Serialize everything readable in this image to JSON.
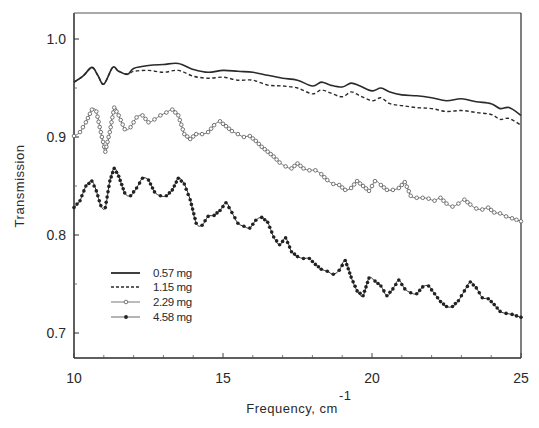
{
  "chart_data": {
    "type": "line",
    "title": "",
    "xlabel": "Frequency, cm",
    "xlabel_superscript": "-1",
    "ylabel": "Transmission",
    "xlim": [
      10,
      25
    ],
    "ylim": [
      0.675,
      1.025
    ],
    "x_ticks": [
      10,
      15,
      20,
      25
    ],
    "x_tick_labels": [
      "10",
      "15",
      "20",
      "25"
    ],
    "y_ticks": [
      0.7,
      0.8,
      0.9,
      1.0
    ],
    "y_tick_labels": [
      "0.7",
      "0.8",
      "0.9",
      "1.0"
    ],
    "grid": false,
    "legend_position": "lower left (inside axes)",
    "series": [
      {
        "name": "0.57 mg",
        "style": "solid",
        "marker": "none",
        "x": [
          10.0,
          10.3,
          10.6,
          10.8,
          11.0,
          11.3,
          11.5,
          11.8,
          12.0,
          12.5,
          13.0,
          13.5,
          14.0,
          14.5,
          15.0,
          15.5,
          16.0,
          16.5,
          17.0,
          17.5,
          18.0,
          18.3,
          18.6,
          19.0,
          19.3,
          19.6,
          20.0,
          20.3,
          20.6,
          21.0,
          21.5,
          22.0,
          22.5,
          23.0,
          23.5,
          24.0,
          24.3,
          24.6,
          25.0
        ],
        "values": [
          0.956,
          0.962,
          0.971,
          0.963,
          0.954,
          0.971,
          0.967,
          0.964,
          0.97,
          0.973,
          0.974,
          0.975,
          0.969,
          0.966,
          0.968,
          0.967,
          0.966,
          0.963,
          0.96,
          0.958,
          0.952,
          0.956,
          0.953,
          0.951,
          0.955,
          0.952,
          0.947,
          0.95,
          0.946,
          0.943,
          0.942,
          0.94,
          0.937,
          0.939,
          0.936,
          0.934,
          0.929,
          0.93,
          0.922
        ]
      },
      {
        "name": "1.15 mg",
        "style": "dashed",
        "marker": "none",
        "x": [
          10.0,
          10.3,
          10.6,
          10.8,
          11.0,
          11.3,
          11.5,
          11.8,
          12.0,
          12.5,
          13.0,
          13.5,
          14.0,
          14.5,
          15.0,
          15.5,
          16.0,
          16.5,
          17.0,
          17.5,
          18.0,
          18.3,
          18.6,
          19.0,
          19.3,
          19.6,
          20.0,
          20.3,
          20.6,
          21.0,
          21.5,
          22.0,
          22.5,
          23.0,
          23.5,
          24.0,
          24.3,
          24.6,
          25.0
        ],
        "values": [
          0.956,
          0.962,
          0.971,
          0.963,
          0.954,
          0.971,
          0.967,
          0.964,
          0.967,
          0.968,
          0.966,
          0.968,
          0.962,
          0.96,
          0.961,
          0.958,
          0.958,
          0.953,
          0.952,
          0.95,
          0.944,
          0.948,
          0.945,
          0.941,
          0.946,
          0.942,
          0.937,
          0.94,
          0.934,
          0.932,
          0.93,
          0.929,
          0.926,
          0.927,
          0.925,
          0.923,
          0.918,
          0.919,
          0.912
        ]
      },
      {
        "name": "2.29 mg",
        "style": "dotted",
        "marker": "open-circle",
        "x": [
          10.0,
          10.2,
          10.4,
          10.6,
          10.75,
          10.9,
          11.05,
          11.2,
          11.35,
          11.5,
          11.7,
          11.9,
          12.1,
          12.3,
          12.5,
          12.7,
          12.9,
          13.1,
          13.3,
          13.5,
          13.7,
          13.9,
          14.1,
          14.3,
          14.5,
          14.7,
          14.9,
          15.1,
          15.3,
          15.5,
          15.7,
          15.9,
          16.1,
          16.3,
          16.5,
          16.7,
          16.9,
          17.1,
          17.3,
          17.5,
          17.7,
          17.9,
          18.1,
          18.3,
          18.5,
          18.7,
          18.9,
          19.1,
          19.3,
          19.5,
          19.7,
          19.9,
          20.1,
          20.3,
          20.5,
          20.7,
          20.9,
          21.1,
          21.3,
          21.5,
          21.7,
          21.9,
          22.1,
          22.3,
          22.5,
          22.7,
          22.9,
          23.1,
          23.3,
          23.5,
          23.7,
          23.9,
          24.1,
          24.3,
          24.5,
          24.7,
          25.0
        ],
        "values": [
          0.901,
          0.905,
          0.915,
          0.928,
          0.926,
          0.905,
          0.885,
          0.905,
          0.93,
          0.922,
          0.908,
          0.91,
          0.92,
          0.922,
          0.915,
          0.918,
          0.922,
          0.925,
          0.928,
          0.922,
          0.903,
          0.898,
          0.903,
          0.903,
          0.905,
          0.912,
          0.916,
          0.911,
          0.906,
          0.903,
          0.9,
          0.901,
          0.896,
          0.89,
          0.885,
          0.88,
          0.874,
          0.87,
          0.868,
          0.873,
          0.868,
          0.866,
          0.866,
          0.862,
          0.856,
          0.852,
          0.851,
          0.846,
          0.848,
          0.855,
          0.85,
          0.845,
          0.855,
          0.851,
          0.846,
          0.846,
          0.848,
          0.854,
          0.84,
          0.838,
          0.838,
          0.837,
          0.835,
          0.838,
          0.832,
          0.829,
          0.832,
          0.836,
          0.831,
          0.827,
          0.826,
          0.828,
          0.823,
          0.822,
          0.819,
          0.817,
          0.814
        ]
      },
      {
        "name": "4.58 mg",
        "style": "solid-thin",
        "marker": "filled-circle",
        "x": [
          10.0,
          10.2,
          10.4,
          10.6,
          10.75,
          10.9,
          11.05,
          11.2,
          11.35,
          11.5,
          11.7,
          11.9,
          12.1,
          12.3,
          12.5,
          12.7,
          12.9,
          13.1,
          13.3,
          13.5,
          13.7,
          13.9,
          14.1,
          14.3,
          14.5,
          14.7,
          14.9,
          15.1,
          15.3,
          15.5,
          15.7,
          15.9,
          16.1,
          16.3,
          16.5,
          16.7,
          16.9,
          17.1,
          17.3,
          17.5,
          17.7,
          17.9,
          18.1,
          18.3,
          18.5,
          18.7,
          18.9,
          19.1,
          19.3,
          19.5,
          19.7,
          19.9,
          20.1,
          20.3,
          20.5,
          20.7,
          20.9,
          21.1,
          21.3,
          21.5,
          21.7,
          21.9,
          22.1,
          22.3,
          22.5,
          22.7,
          22.9,
          23.1,
          23.3,
          23.5,
          23.7,
          23.9,
          24.1,
          24.3,
          24.5,
          24.7,
          25.0
        ],
        "values": [
          0.828,
          0.835,
          0.85,
          0.855,
          0.845,
          0.83,
          0.828,
          0.855,
          0.868,
          0.86,
          0.843,
          0.84,
          0.848,
          0.858,
          0.856,
          0.844,
          0.84,
          0.84,
          0.846,
          0.858,
          0.852,
          0.836,
          0.812,
          0.81,
          0.819,
          0.82,
          0.825,
          0.833,
          0.823,
          0.812,
          0.809,
          0.807,
          0.815,
          0.818,
          0.813,
          0.798,
          0.79,
          0.797,
          0.783,
          0.778,
          0.776,
          0.776,
          0.77,
          0.765,
          0.763,
          0.76,
          0.764,
          0.774,
          0.757,
          0.743,
          0.738,
          0.756,
          0.753,
          0.748,
          0.738,
          0.745,
          0.754,
          0.745,
          0.741,
          0.74,
          0.747,
          0.748,
          0.74,
          0.732,
          0.727,
          0.727,
          0.733,
          0.743,
          0.752,
          0.746,
          0.736,
          0.735,
          0.729,
          0.722,
          0.72,
          0.719,
          0.716
        ]
      }
    ],
    "legend": [
      {
        "label": "0.57 mg",
        "style": "solid"
      },
      {
        "label": "1.15 mg",
        "style": "dashed"
      },
      {
        "label": "2.29 mg",
        "style": "open-circle"
      },
      {
        "label": "4.58 mg",
        "style": "filled-circle"
      }
    ]
  },
  "axes": {
    "y_label": "Transmission",
    "x_label": "Frequency,  cm",
    "x_label_sup": "-1",
    "y_tick_labels": [
      "1.0",
      "0.9",
      "0.8",
      "0.7"
    ],
    "x_tick_labels": [
      "10",
      "15",
      "20",
      "25"
    ]
  },
  "legend": {
    "items": [
      "0.57 mg",
      "1.15 mg",
      "2.29 mg",
      "4.58 mg"
    ]
  },
  "colors": {
    "ink": "#2a2a2a",
    "open_marker_ink": "#555555",
    "background": "#ffffff"
  }
}
